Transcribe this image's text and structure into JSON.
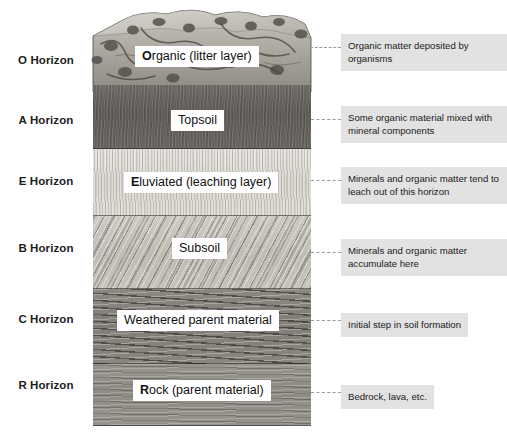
{
  "diagram": {
    "horizons": [
      {
        "id": "o",
        "side_label": "O Horizon",
        "chip_bold": "O",
        "chip_rest": "rganic (litter layer)",
        "note": "Organic matter deposited by organisms"
      },
      {
        "id": "a",
        "side_label": "A Horizon",
        "chip_bold": "",
        "chip_rest": "Topsoil",
        "note": "Some organic material mixed with mineral components"
      },
      {
        "id": "e",
        "side_label": "E Horizon",
        "chip_bold": "E",
        "chip_rest": "luviated (leaching layer)",
        "note": "Minerals and organic matter tend to leach out of this horizon"
      },
      {
        "id": "b",
        "side_label": "B Horizon",
        "chip_bold": "",
        "chip_rest": "Subsoil",
        "note": "Minerals and organic matter accumulate here"
      },
      {
        "id": "c",
        "side_label": "C Horizon",
        "chip_bold": "",
        "chip_rest": "Weathered parent material",
        "note": "Initial step in soil formation"
      },
      {
        "id": "r",
        "side_label": "R Horizon",
        "chip_bold": "R",
        "chip_rest": "ock (parent material)",
        "note": "Bedrock, lava, etc."
      }
    ],
    "colors": {
      "note_background": "#e2e2e2",
      "chip_background": "#ffffff",
      "text": "#1b1b1b",
      "leader_line": "#9a9a9a",
      "horizon_a": "#625e5a",
      "horizon_e": "#e4e1db",
      "horizon_b": "#c3c0b8",
      "horizon_c": "#857f79",
      "horizon_r": "#938f89"
    }
  }
}
